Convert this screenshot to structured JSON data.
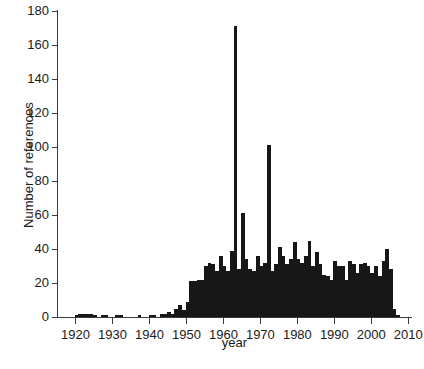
{
  "figure": {
    "ylabel": "Number of references",
    "xlabel": "year",
    "caption_fragment": ""
  },
  "chart_data": {
    "type": "bar",
    "title": "",
    "subtitle": "",
    "xlabel": "year",
    "ylabel": "Number of references",
    "xlim": [
      1915,
      2011
    ],
    "ylim": [
      0,
      180
    ],
    "yticks": [
      0,
      20,
      40,
      60,
      80,
      100,
      120,
      140,
      160,
      180
    ],
    "xticks": [
      1920,
      1930,
      1940,
      1950,
      1960,
      1970,
      1980,
      1990,
      2000,
      2010
    ],
    "grid": false,
    "legend": null,
    "bar_color": "#171717",
    "axis_color": "#3a3a3a",
    "x": [
      1917,
      1918,
      1919,
      1920,
      1921,
      1922,
      1923,
      1924,
      1925,
      1926,
      1927,
      1928,
      1929,
      1930,
      1931,
      1932,
      1933,
      1934,
      1935,
      1936,
      1937,
      1938,
      1939,
      1940,
      1941,
      1942,
      1943,
      1944,
      1945,
      1946,
      1947,
      1948,
      1949,
      1950,
      1951,
      1952,
      1953,
      1954,
      1955,
      1956,
      1957,
      1958,
      1959,
      1960,
      1961,
      1962,
      1963,
      1964,
      1965,
      1966,
      1967,
      1968,
      1969,
      1970,
      1971,
      1972,
      1973,
      1974,
      1975,
      1976,
      1977,
      1978,
      1979,
      1980,
      1981,
      1982,
      1983,
      1984,
      1985,
      1986,
      1987,
      1988,
      1989,
      1990,
      1991,
      1992,
      1993,
      1994,
      1995,
      1996,
      1997,
      1998,
      1999,
      2000,
      2001,
      2002,
      2003,
      2004,
      2005,
      2006,
      2007
    ],
    "values": [
      0,
      0,
      0,
      1,
      2,
      2,
      2,
      2,
      1,
      0,
      1,
      1,
      0,
      0,
      1,
      1,
      0,
      0,
      0,
      0,
      1,
      0,
      0,
      1,
      1,
      0,
      2,
      2,
      3,
      2,
      5,
      7,
      4,
      9,
      21,
      21,
      22,
      22,
      30,
      32,
      31,
      27,
      36,
      30,
      27,
      39,
      171,
      28,
      61,
      34,
      28,
      27,
      36,
      30,
      32,
      101,
      27,
      31,
      41,
      36,
      31,
      34,
      44,
      34,
      32,
      36,
      45,
      30,
      38,
      31,
      25,
      24,
      22,
      33,
      30,
      30,
      22,
      33,
      31,
      26,
      31,
      32,
      30,
      26,
      30,
      24,
      33,
      40,
      28,
      5,
      1
    ]
  }
}
